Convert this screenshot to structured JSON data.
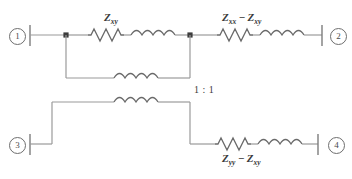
{
  "diagram": {
    "type": "circuit-schematic",
    "ports": [
      {
        "id": "port-1",
        "label": "1",
        "position": "top-left"
      },
      {
        "id": "port-2",
        "label": "2",
        "position": "top-right"
      },
      {
        "id": "port-3",
        "label": "3",
        "position": "bottom-left"
      },
      {
        "id": "port-4",
        "label": "4",
        "position": "bottom-right"
      }
    ],
    "branches": [
      {
        "id": "branch-top-left",
        "label_text": "Zxy",
        "label_base": "Z",
        "label_sub": "xy",
        "components": [
          "resistor",
          "inductor"
        ]
      },
      {
        "id": "branch-top-right",
        "label_text": "Zxx - Zxy",
        "label_base_1": "Z",
        "label_sub_1": "xx",
        "operator": "−",
        "label_base_2": "Z",
        "label_sub_2": "xy",
        "components": [
          "resistor",
          "inductor"
        ]
      },
      {
        "id": "branch-bottom-right",
        "label_text": "Zyy - Zxy",
        "label_base_1": "Z",
        "label_sub_1": "yy",
        "operator": "−",
        "label_base_2": "Z",
        "label_sub_2": "xy",
        "components": [
          "resistor",
          "inductor"
        ]
      }
    ],
    "transformer": {
      "id": "ideal-transformer",
      "ratio_label": "1 : 1",
      "primary_coil_bumps": 4,
      "secondary_coil_bumps": 4
    },
    "nodes": [
      {
        "id": "junction-left",
        "type": "dot"
      },
      {
        "id": "junction-right",
        "type": "dot"
      }
    ],
    "colors": {
      "wire": "#8a8a8a",
      "component": "#5a5a5a",
      "text": "#3a3a3a",
      "background": "#ffffff"
    }
  }
}
